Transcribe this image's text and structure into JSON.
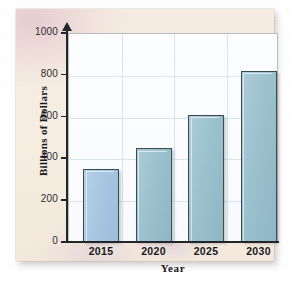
{
  "chart_data": {
    "type": "bar",
    "title": "",
    "subtitle": "",
    "xlabel": "Year",
    "ylabel": "Billions of Dollars",
    "categories": [
      "2015",
      "2020",
      "2025",
      "2030"
    ],
    "values": [
      350,
      450,
      610,
      820
    ],
    "series": [
      {
        "name": "Billions of Dollars",
        "values": [
          350,
          450,
          610,
          820
        ]
      }
    ],
    "ylim": [
      0,
      1000
    ],
    "yticks": [
      "0",
      "200",
      "400",
      "600",
      "800",
      "1000"
    ],
    "ytick_values": [
      0,
      200,
      400,
      600,
      800,
      1000
    ],
    "xticks": [
      "2015",
      "2020",
      "2025",
      "2030"
    ],
    "grid": true,
    "grid_axis": "both",
    "legend": false,
    "legend_position": "none",
    "bar_colors": [
      "#a9c9e2",
      "#9dc3d0",
      "#9dc3d0",
      "#9dc3d0"
    ],
    "bar_edge_color": "#3c4a52",
    "grid_color": "#d6e7f2",
    "axis_color": "#22252a",
    "plot_background": "#fbfdfe",
    "page_background": "#f6ece1"
  },
  "axes": {
    "y_title": "Billions of Dollars",
    "x_title": "Year",
    "y_ticks": [
      {
        "label": "1000",
        "value": 1000
      },
      {
        "label": "800",
        "value": 800
      },
      {
        "label": "600",
        "value": 600
      },
      {
        "label": "400",
        "value": 400
      },
      {
        "label": "200",
        "value": 200
      },
      {
        "label": "0",
        "value": 0
      }
    ],
    "x_ticks": [
      {
        "label": "2015",
        "value": 350
      },
      {
        "label": "2020",
        "value": 450
      },
      {
        "label": "2025",
        "value": 610
      },
      {
        "label": "2030",
        "value": 820
      }
    ]
  }
}
